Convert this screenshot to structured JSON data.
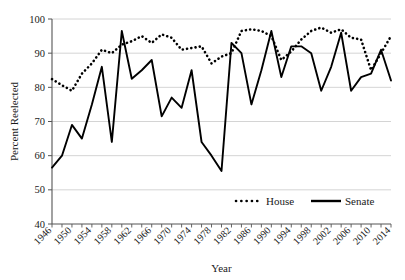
{
  "chart_data": {
    "type": "line",
    "title": "",
    "xlabel": "Year",
    "ylabel": "Percent Reelected",
    "xlim": [
      1946,
      2014
    ],
    "ylim": [
      40,
      100
    ],
    "ytick_values": [
      40,
      50,
      60,
      70,
      80,
      90,
      100
    ],
    "ytick_labels": [
      "40",
      "50",
      "60",
      "70",
      "80",
      "90",
      "100"
    ],
    "xtick_labels": [
      "1946",
      "1950",
      "1954",
      "1958",
      "1962",
      "1966",
      "1970",
      "1974",
      "1978",
      "1982",
      "1986",
      "1990",
      "1994",
      "1998",
      "2002",
      "2006",
      "2010",
      "2014"
    ],
    "xtick_step": 4,
    "minor_tick_step": 2,
    "grid": "horizontal",
    "legend_position": "bottom-right",
    "x": [
      1946,
      1948,
      1950,
      1952,
      1954,
      1956,
      1958,
      1960,
      1962,
      1964,
      1966,
      1968,
      1970,
      1972,
      1974,
      1976,
      1978,
      1980,
      1982,
      1984,
      1986,
      1988,
      1990,
      1992,
      1994,
      1996,
      1998,
      2000,
      2002,
      2004,
      2006,
      2008,
      2010,
      2012,
      2014
    ],
    "series": [
      {
        "name": "House",
        "style": "dotted",
        "color": "#000000",
        "values": [
          82.4,
          80.6,
          79.0,
          84.0,
          87.0,
          91.0,
          90.0,
          92.5,
          93.5,
          95.0,
          93.0,
          95.5,
          94.5,
          91.0,
          91.5,
          92.0,
          87.0,
          89.0,
          90.0,
          96.5,
          97.0,
          96.5,
          95.0,
          88.0,
          90.5,
          94.0,
          96.5,
          97.5,
          96.0,
          97.0,
          94.5,
          94.0,
          85.0,
          90.0,
          95.0
        ]
      },
      {
        "name": "Senate",
        "style": "solid",
        "color": "#000000",
        "values": [
          56.5,
          60.0,
          69.0,
          65.0,
          75.0,
          86.0,
          64.0,
          96.5,
          82.5,
          85.0,
          88.0,
          71.5,
          77.0,
          74.0,
          85.0,
          64.0,
          60.0,
          55.5,
          93.0,
          90.0,
          75.0,
          85.0,
          96.5,
          83.0,
          92.0,
          92.0,
          90.0,
          79.0,
          86.0,
          96.0,
          79.0,
          83.0,
          84.0,
          91.0,
          82.0
        ]
      }
    ],
    "legend": [
      {
        "label": "House",
        "style": "dotted"
      },
      {
        "label": "Senate",
        "style": "solid"
      }
    ]
  }
}
